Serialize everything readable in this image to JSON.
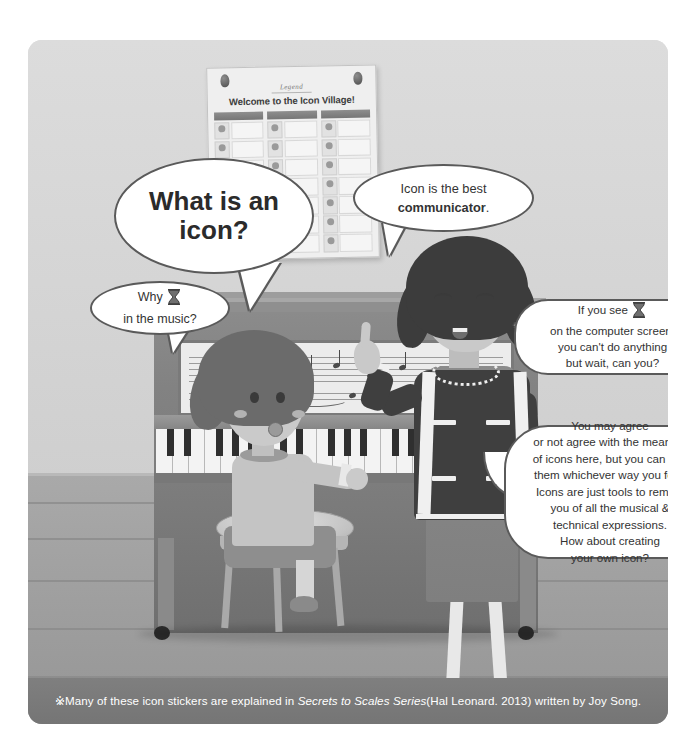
{
  "illustration": {
    "poster": {
      "legend_label": "Legend",
      "title": "Welcome to the Icon Village!",
      "columns": 3,
      "rows_per_column": 7
    },
    "speech_bubbles": [
      {
        "id": "what-is-an-icon",
        "speaker": "girl",
        "lines": [
          "What is an",
          "icon?"
        ],
        "style": "bold-large"
      },
      {
        "id": "best-communicator",
        "speaker": "teacher",
        "line_plain": "Icon is the best",
        "line_bold": "communicator",
        "line_tail": "."
      },
      {
        "id": "why-in-the-music",
        "speaker": "girl",
        "line_before_icon": "Why",
        "icon": "hourglass-icon",
        "line_after": "in the music?"
      },
      {
        "id": "if-you-see-hourglass",
        "speaker": "teacher",
        "line_before_icon": "If you see",
        "icon": "hourglass-icon",
        "lines": [
          "on the computer screen,",
          "you can't do anything",
          "but wait, can you?"
        ]
      },
      {
        "id": "you-may-agree",
        "speaker": "teacher",
        "lines": [
          "You may agree",
          "or not agree with the meaning",
          "of icons here, but you can use",
          "them whichever way you feel.",
          "Icons are just tools to remind",
          "you of all the musical &",
          "technical expressions.",
          "How about creating",
          "your own icon?"
        ]
      }
    ],
    "scene": {
      "characters": [
        "girl-student",
        "woman-teacher"
      ],
      "objects": [
        "upright-piano",
        "piano-bench",
        "wall-poster",
        "sheet-music"
      ]
    }
  },
  "caption": {
    "mark": "※",
    "text_before_italic": "Many of these icon stickers are explained in ",
    "italic_title": "Secrets to Scales Series",
    "text_after_italic": "(Hal Leonard. 2013) written by Joy Song."
  },
  "colors": {
    "wall": "#d8d8d8",
    "floor": "#a0a0a0",
    "piano": "#838383",
    "jacket": "#3f3f3f",
    "bubble_fill": "#ffffff",
    "bubble_stroke": "#5a5a5a",
    "caption_bar": "#7a7a7a",
    "text": "#333333"
  }
}
